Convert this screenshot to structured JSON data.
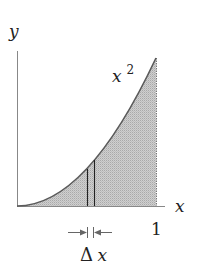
{
  "diagram": {
    "labels": {
      "y_axis": "y",
      "x_axis": "x",
      "curve_base": "x",
      "curve_exponent": "2",
      "x_tick_end": "1",
      "delta_symbol": "Δ",
      "delta_var": "x"
    },
    "elements": {
      "curve": "y = x^2 on [0, 1]",
      "shaded_region": "area under curve from 0 to 1",
      "strip": "narrow vertical strip of width Δx",
      "dimension_arrows": "arrows pointing inward to mark width Δx"
    },
    "colors": {
      "axis": "#888888",
      "curve": "#555555",
      "fill": "#c9c9c9",
      "fill_dot": "#a8a8a8",
      "strip_lines": "#222222",
      "text": "#222222"
    }
  }
}
